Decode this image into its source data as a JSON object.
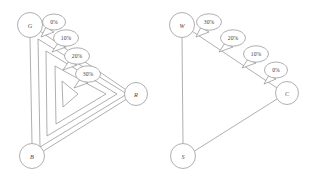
{
  "figure": {
    "background_color": "#ffffff",
    "stroke_color": "#8d8d8f",
    "text_color": "#404042",
    "panels": [
      {
        "id": "left-panel",
        "name": "nested-triangle-diagram",
        "nodes": [
          {
            "id": "G",
            "label": "G",
            "cx": 30,
            "cy": 25,
            "r": 12.5
          },
          {
            "id": "B",
            "label": "B",
            "cx": 32,
            "cy": 156,
            "r": 12.5
          },
          {
            "id": "R",
            "label": "R",
            "cx": 136,
            "cy": 94,
            "r": 11.5
          }
        ],
        "callouts": [
          {
            "id": "L0",
            "label": "0%",
            "cx": 54,
            "cy": 22,
            "rx": 11.5,
            "ry": 8.0,
            "tail_x": 41,
            "tail_y": 37
          },
          {
            "id": "L1",
            "label": "10%",
            "cx": 66,
            "cy": 38,
            "rx": 12.5,
            "ry": 8.2,
            "tail_x": 52,
            "tail_y": 52
          },
          {
            "id": "L2",
            "label": "20%",
            "cx": 77,
            "cy": 56,
            "rx": 12.5,
            "ry": 8.2,
            "tail_x": 63,
            "tail_y": 70
          },
          {
            "id": "L3",
            "label": "30%",
            "cx": 88,
            "cy": 74,
            "rx": 12.5,
            "ry": 8.2,
            "tail_x": 74,
            "tail_y": 88
          }
        ]
      },
      {
        "id": "right-panel",
        "name": "open-triangle-diagram",
        "nodes": [
          {
            "id": "W",
            "label": "W",
            "cx": 182,
            "cy": 25,
            "r": 12.5
          },
          {
            "id": "S",
            "label": "S",
            "cx": 183,
            "cy": 156,
            "r": 12.5
          },
          {
            "id": "C",
            "label": "C",
            "cx": 287,
            "cy": 93,
            "r": 11.5
          }
        ],
        "callouts": [
          {
            "id": "R0",
            "label": "30%",
            "cx": 209,
            "cy": 22,
            "rx": 12.5,
            "ry": 8.2,
            "tail_x": 196,
            "tail_y": 37
          },
          {
            "id": "R1",
            "label": "20%",
            "cx": 233,
            "cy": 38,
            "rx": 12.5,
            "ry": 8.2,
            "tail_x": 219,
            "tail_y": 52
          },
          {
            "id": "R2",
            "label": "10%",
            "cx": 256,
            "cy": 54,
            "rx": 12.5,
            "ry": 8.2,
            "tail_x": 242,
            "tail_y": 68
          },
          {
            "id": "R3",
            "label": "0%",
            "cx": 276,
            "cy": 70,
            "rx": 11.5,
            "ry": 8.0,
            "tail_x": 264,
            "tail_y": 84
          }
        ]
      }
    ],
    "labels": {
      "node_G": "G",
      "node_B": "B",
      "node_R": "R",
      "node_W": "W",
      "node_S": "S",
      "node_C": "C",
      "left_pct_0": "0%",
      "left_pct_1": "10%",
      "left_pct_2": "20%",
      "left_pct_3": "30%",
      "right_pct_0": "30%",
      "right_pct_1": "20%",
      "right_pct_2": "10%",
      "right_pct_3": "0%"
    }
  }
}
